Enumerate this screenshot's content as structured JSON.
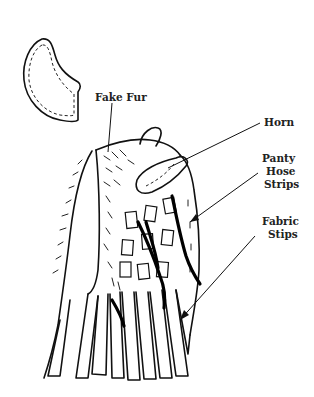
{
  "diagram": {
    "labels": {
      "fake_fur": "Fake Fur",
      "horn": "Horn",
      "panty_hose_strips": [
        "Panty",
        "Hose",
        "Strips"
      ],
      "fabric_strips": [
        "Fabric",
        "Stips"
      ]
    },
    "parts": [
      "horn-pattern-piece",
      "headpiece-body",
      "fake-fur-back",
      "fabric-patches",
      "panty-hose-strips",
      "fabric-fringe-strips"
    ],
    "colors": {
      "ink": "#111111",
      "background": "#ffffff"
    }
  }
}
